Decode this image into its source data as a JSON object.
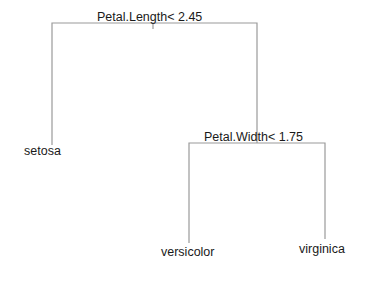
{
  "diagram": {
    "type": "decision-tree",
    "colors": {
      "line": "#9a9a9a",
      "text": "#1a1a1a",
      "background": "#ffffff"
    },
    "nodes": [
      {
        "id": "root",
        "kind": "split",
        "label": "Petal.Length< 2.45"
      },
      {
        "id": "n2",
        "kind": "split",
        "label": "Petal.Width< 1.75"
      },
      {
        "id": "leaf_setosa",
        "kind": "leaf",
        "label": "setosa"
      },
      {
        "id": "leaf_versicolor",
        "kind": "leaf",
        "label": "versicolor"
      },
      {
        "id": "leaf_virginica",
        "kind": "leaf",
        "label": "virginica"
      }
    ],
    "edges": [
      {
        "from": "root",
        "to": "leaf_setosa"
      },
      {
        "from": "root",
        "to": "n2"
      },
      {
        "from": "n2",
        "to": "leaf_versicolor"
      },
      {
        "from": "n2",
        "to": "leaf_virginica"
      }
    ]
  }
}
